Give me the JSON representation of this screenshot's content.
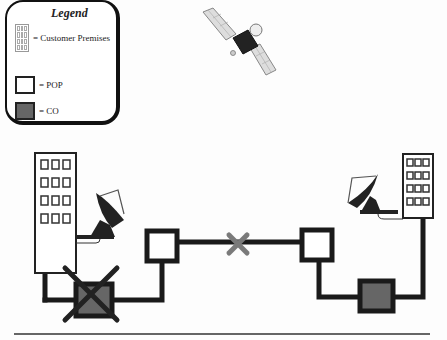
{
  "legend": {
    "title": "Legend",
    "items": [
      {
        "symbol": "building-icon",
        "label": "= Customer Premises"
      },
      {
        "symbol": "pop-square",
        "label": "= POP"
      },
      {
        "symbol": "co-square",
        "label": "= CO"
      }
    ]
  },
  "colors": {
    "line": "#1a1a1a",
    "co_fill": "#666666",
    "pop_fill": "#ffffff",
    "failure_x_gray": "#7a7a7a",
    "failure_x_dark": "#222222"
  },
  "diagram": {
    "nodes": [
      {
        "id": "satellite",
        "type": "satellite"
      },
      {
        "id": "left-building",
        "type": "customer-premises"
      },
      {
        "id": "left-dish",
        "type": "satellite-dish"
      },
      {
        "id": "left-pop",
        "type": "POP"
      },
      {
        "id": "left-co",
        "type": "CO",
        "status": "failed"
      },
      {
        "id": "right-pop",
        "type": "POP"
      },
      {
        "id": "right-co",
        "type": "CO"
      },
      {
        "id": "right-dish",
        "type": "satellite-dish"
      },
      {
        "id": "right-building",
        "type": "customer-premises"
      }
    ],
    "links": [
      {
        "from": "left-building",
        "to": "left-co"
      },
      {
        "from": "left-co",
        "to": "left-pop"
      },
      {
        "from": "left-pop",
        "to": "right-pop",
        "status": "failed"
      },
      {
        "from": "right-pop",
        "to": "right-co"
      },
      {
        "from": "right-co",
        "to": "right-building"
      }
    ]
  }
}
